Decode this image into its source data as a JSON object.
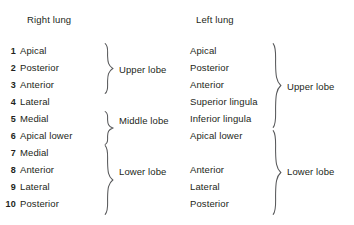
{
  "figure": {
    "background_color": "#ffffff",
    "text_color": "#231f20",
    "brace_color": "#58595b"
  },
  "columns": {
    "right": {
      "title": "Right lung",
      "segments": [
        {
          "number": "1",
          "name": "Apical"
        },
        {
          "number": "2",
          "name": "Posterior"
        },
        {
          "number": "3",
          "name": "Anterior"
        },
        {
          "number": "4",
          "name": "Lateral"
        },
        {
          "number": "5",
          "name": "Medial"
        },
        {
          "number": "6",
          "name": "Apical lower"
        },
        {
          "number": "7",
          "name": "Medial"
        },
        {
          "number": "8",
          "name": "Anterior"
        },
        {
          "number": "9",
          "name": "Lateral"
        },
        {
          "number": "10",
          "name": "Posterior"
        }
      ],
      "lobes": [
        {
          "label": "Upper lobe",
          "segment_numbers": [
            "1",
            "2",
            "3"
          ]
        },
        {
          "label": "Middle lobe",
          "segment_numbers": [
            "4",
            "5"
          ]
        },
        {
          "label": "Lower lobe",
          "segment_numbers": [
            "6",
            "7",
            "8",
            "9",
            "10"
          ]
        }
      ]
    },
    "left": {
      "title": "Left lung",
      "segments": [
        {
          "number": "",
          "name": "Apical"
        },
        {
          "number": "",
          "name": "Posterior"
        },
        {
          "number": "",
          "name": "Anterior"
        },
        {
          "number": "",
          "name": "Superior lingula"
        },
        {
          "number": "",
          "name": "Inferior lingula"
        },
        {
          "number": "",
          "name": "Apical lower"
        },
        {
          "number": "",
          "name": ""
        },
        {
          "number": "",
          "name": "Anterior"
        },
        {
          "number": "",
          "name": "Lateral"
        },
        {
          "number": "",
          "name": "Posterior"
        }
      ],
      "lobes": [
        {
          "label": "Upper lobe",
          "segment_names": [
            "Apical",
            "Posterior",
            "Anterior",
            "Superior lingula",
            "Inferior lingula"
          ]
        },
        {
          "label": "Lower lobe",
          "segment_names": [
            "Apical lower",
            "Anterior",
            "Lateral",
            "Posterior"
          ]
        }
      ]
    }
  }
}
